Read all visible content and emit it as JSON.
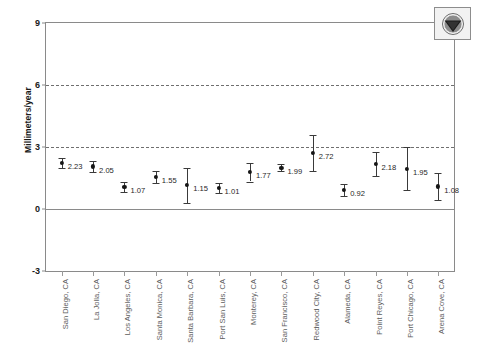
{
  "figure": {
    "logo_alt": "noaa-logo"
  },
  "chart_data": {
    "type": "scatter",
    "title": "",
    "xlabel": "",
    "ylabel": "Millimeters/year",
    "ylim": [
      -3,
      9
    ],
    "yticks": [
      9,
      6,
      3,
      0,
      -3
    ],
    "ytick_labels": [
      "9",
      "6",
      "3",
      "0",
      "-3"
    ],
    "grid": true,
    "gridlines_dashed_at": [
      6,
      3
    ],
    "gridlines_solid_at": [
      0
    ],
    "legend": "none",
    "categories": [
      "San Diego, CA",
      "La Jolla, CA",
      "Los Angeles, CA",
      "Santa Monica, CA",
      "Santa Barbara, CA",
      "Port San Luis, CA",
      "Monterey, CA",
      "San Francisco, CA",
      "Redwood City, CA",
      "Alameda, CA",
      "Point Reyes, CA",
      "Port Chicago, CA",
      "Arena Cove, CA"
    ],
    "values": [
      2.23,
      2.05,
      1.07,
      1.55,
      1.15,
      1.01,
      1.77,
      1.99,
      2.72,
      0.92,
      2.18,
      1.95,
      1.08
    ],
    "value_labels": [
      "2.23",
      "2.05",
      "1.07",
      "1.55",
      "1.15",
      "1.01",
      "1.77",
      "1.99",
      "2.72",
      "0.92",
      "2.18",
      "1.95",
      "1.08"
    ],
    "error_low": [
      1.99,
      1.79,
      0.83,
      1.26,
      0.3,
      0.76,
      1.33,
      1.82,
      1.84,
      0.62,
      1.62,
      0.92,
      0.42
    ],
    "error_high": [
      2.47,
      2.31,
      1.31,
      1.84,
      2.0,
      1.26,
      2.21,
      2.16,
      3.6,
      1.22,
      2.74,
      2.98,
      1.74
    ],
    "series": [
      {
        "name": "Mean sea level trend",
        "values": [
          2.23,
          2.05,
          1.07,
          1.55,
          1.15,
          1.01,
          1.77,
          1.99,
          2.72,
          0.92,
          2.18,
          1.95,
          1.08
        ]
      }
    ],
    "colors": {
      "marker": "#161616",
      "errorbar": "#3a3a3a",
      "gridline": "#6f6f6f",
      "axis": "#8a8a8a",
      "tick_label": "#5d5d5d"
    }
  }
}
